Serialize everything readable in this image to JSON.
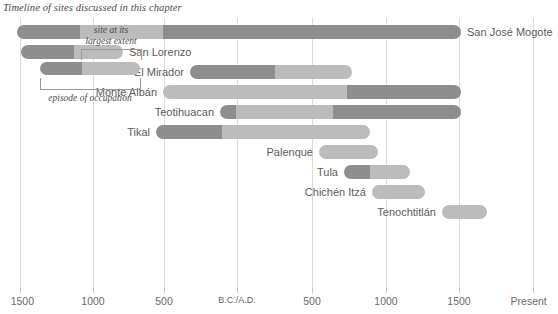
{
  "chart": {
    "title": "Timeline of sites discussed in this chapter"
  },
  "colors": {
    "bar_dark": "#8e8e8e",
    "bar_light": "#bcbcbc",
    "gridline": "#dcdcdc",
    "text": "#5c5c5c",
    "background": "#ffffff"
  },
  "legend": {
    "top_label_line1": "site at its",
    "top_label_line2": "largest extent",
    "bottom_label": "episode of occupation"
  },
  "axis": {
    "label_bc_ad": "B.C./A.D.",
    "label_present": "Present",
    "ticks": [
      {
        "label": "1500",
        "year": -1500,
        "x": 20
      },
      {
        "label": "1000",
        "year": -1000,
        "x": 93
      },
      {
        "label": "500",
        "year": -500,
        "x": 164
      },
      {
        "label": "B.C./A.D.",
        "year": 0,
        "x": 237
      },
      {
        "label": "500",
        "year": 500,
        "x": 312
      },
      {
        "label": "1000",
        "year": 1000,
        "x": 386
      },
      {
        "label": "1500",
        "year": 1500,
        "x": 459
      },
      {
        "label": "Present",
        "year": 2000,
        "x": 533
      }
    ]
  },
  "chart_data": {
    "type": "bar",
    "subtype": "timeline-gantt",
    "title": "Timeline of sites discussed in this chapter",
    "xlabel": "",
    "ylabel": "",
    "xlim": [
      -1600,
      2050
    ],
    "x_tick_labels": [
      "1500",
      "1000",
      "500",
      "B.C./A.D.",
      "500",
      "1000",
      "1500",
      "Present"
    ],
    "x_tick_years": [
      -1500,
      -1000,
      -500,
      0,
      500,
      1000,
      1500,
      2000
    ],
    "grid": true,
    "legend_position": "lower-left-inset",
    "series_names": [
      "episode of occupation",
      "site at its largest extent"
    ],
    "categories": [
      "San José Mogote",
      "San Lorenzo",
      "El Mirador",
      "Monte Albán",
      "Teotihuacan",
      "Tikal",
      "Palenque",
      "Tula",
      "Chichén Itzá",
      "Tenochtitlán"
    ],
    "bars": [
      {
        "name": "San José Mogote",
        "label_side": "right",
        "start_year": -1520,
        "end_year": 1500,
        "segments": [
          {
            "kind": "occupation",
            "start_px": 17,
            "end_px": 80
          },
          {
            "kind": "largest-extent",
            "start_px": 80,
            "end_px": 163
          },
          {
            "kind": "occupation",
            "start_px": 163,
            "end_px": 461
          }
        ]
      },
      {
        "name": "San Lorenzo",
        "label_side": "right",
        "start_year": -1480,
        "end_year": -780,
        "segments": [
          {
            "kind": "occupation",
            "start_px": 21,
            "end_px": 74
          },
          {
            "kind": "largest-extent",
            "start_px": 74,
            "end_px": 123
          }
        ]
      },
      {
        "name": "El Mirador",
        "label_side": "left",
        "start_year": -320,
        "end_year": 800,
        "segments": [
          {
            "kind": "occupation",
            "start_px": 190,
            "end_px": 275
          },
          {
            "kind": "largest-extent",
            "start_px": 275,
            "end_px": 352
          }
        ]
      },
      {
        "name": "Monte Albán",
        "label_side": "left",
        "start_year": -500,
        "end_year": 1500,
        "segments": [
          {
            "kind": "largest-extent",
            "start_px": 163,
            "end_px": 347
          },
          {
            "kind": "occupation",
            "start_px": 347,
            "end_px": 461
          }
        ]
      },
      {
        "name": "Teotihuacan",
        "label_side": "left",
        "start_year": -110,
        "end_year": 1500,
        "segments": [
          {
            "kind": "occupation",
            "start_px": 220,
            "end_px": 236
          },
          {
            "kind": "largest-extent",
            "start_px": 236,
            "end_px": 333
          },
          {
            "kind": "occupation",
            "start_px": 333,
            "end_px": 461
          }
        ]
      },
      {
        "name": "Tikal",
        "label_side": "left",
        "start_year": -560,
        "end_year": 900,
        "segments": [
          {
            "kind": "occupation",
            "start_px": 156,
            "end_px": 222
          },
          {
            "kind": "largest-extent",
            "start_px": 222,
            "end_px": 370
          }
        ]
      },
      {
        "name": "Palenque",
        "label_side": "left",
        "start_year": 550,
        "end_year": 950,
        "segments": [
          {
            "kind": "largest-extent",
            "start_px": 319,
            "end_px": 378
          }
        ]
      },
      {
        "name": "Tula",
        "label_side": "left",
        "start_year": 720,
        "end_year": 1170,
        "segments": [
          {
            "kind": "occupation",
            "start_px": 344,
            "end_px": 370
          },
          {
            "kind": "largest-extent",
            "start_px": 370,
            "end_px": 410
          }
        ]
      },
      {
        "name": "Chichén Itzá",
        "label_side": "left",
        "start_year": 910,
        "end_year": 1270,
        "segments": [
          {
            "kind": "largest-extent",
            "start_px": 372,
            "end_px": 425
          }
        ]
      },
      {
        "name": "Tenochtitlán",
        "label_side": "left",
        "start_year": 1390,
        "end_year": 1700,
        "segments": [
          {
            "kind": "largest-extent",
            "start_px": 442,
            "end_px": 487
          }
        ]
      }
    ]
  }
}
